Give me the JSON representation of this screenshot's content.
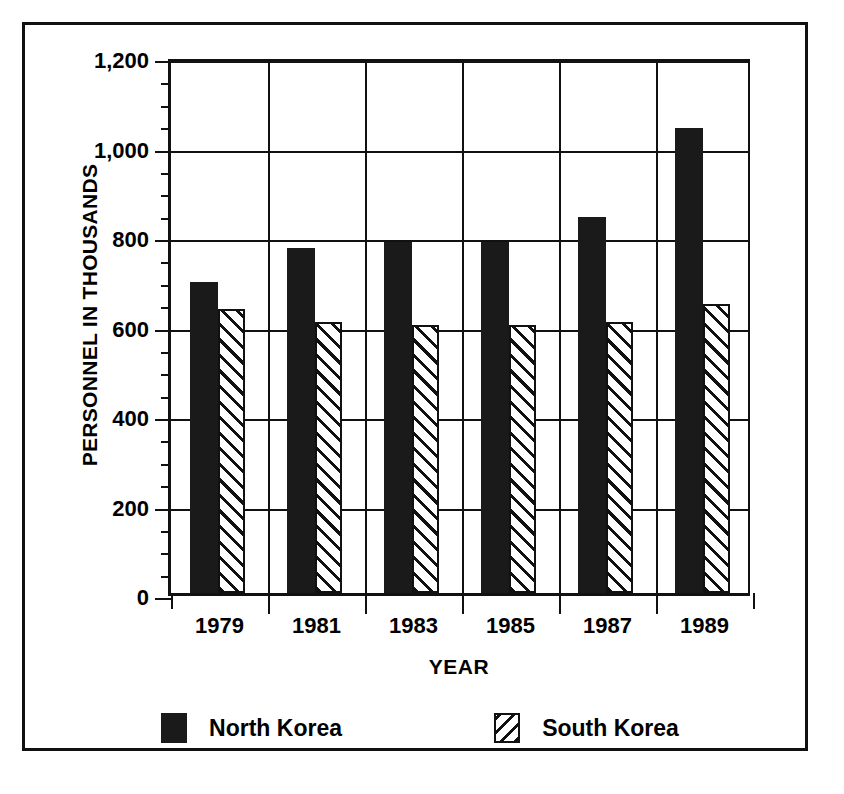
{
  "chart_data": {
    "type": "bar",
    "title": "",
    "xlabel": "YEAR",
    "ylabel": "PERSONNEL IN THOUSANDS",
    "categories": [
      "1979",
      "1981",
      "1983",
      "1985",
      "1987",
      "1989"
    ],
    "series": [
      {
        "name": "North Korea",
        "values": [
          695,
          770,
          785,
          785,
          840,
          1040
        ],
        "fill": "solid",
        "color": "#1a1a1a"
      },
      {
        "name": "South Korea",
        "values": [
          635,
          605,
          600,
          600,
          605,
          645
        ],
        "fill": "hatch",
        "color": "#ffffff"
      }
    ],
    "ylim": [
      0,
      1200
    ],
    "ytick_labels": [
      "0",
      "200",
      "400",
      "600",
      "800",
      "1,000",
      "1,200"
    ],
    "ytick_values": [
      0,
      200,
      400,
      600,
      800,
      1000,
      1200
    ],
    "yminor_step": 50,
    "grid": "both",
    "legend_position": "bottom"
  },
  "legend": {
    "items": [
      {
        "label": "North Korea",
        "swatch": "solid-black-square"
      },
      {
        "label": "South Korea",
        "swatch": "hatched-square"
      }
    ]
  }
}
